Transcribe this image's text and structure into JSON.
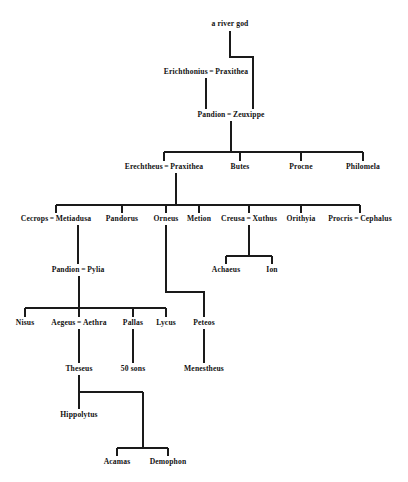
{
  "chart_data": {
    "type": "diagram",
    "diagram_kind": "family-tree",
    "line_color": "#1a1a1a",
    "background_color": "#ffffff",
    "text_color": "#111111",
    "nodes": [
      {
        "id": "river-god",
        "label": "a river god",
        "x": 230,
        "y": 24,
        "gen": 0
      },
      {
        "id": "erichthonius",
        "label": "Erichthonius",
        "partner": "Praxithea",
        "x": 206,
        "y": 72,
        "gen": 1
      },
      {
        "id": "pandion-1",
        "label": "Pandion",
        "partner": "Zeuxippe",
        "x": 231,
        "y": 115,
        "gen": 2
      },
      {
        "id": "erechtheus",
        "label": "Erechtheus",
        "partner": "Praxithea",
        "x": 164,
        "y": 167,
        "gen": 3
      },
      {
        "id": "butes",
        "label": "Butes",
        "x": 240,
        "y": 167,
        "gen": 3
      },
      {
        "id": "procne",
        "label": "Procne",
        "x": 301,
        "y": 167,
        "gen": 3
      },
      {
        "id": "philomela",
        "label": "Philomela",
        "x": 363,
        "y": 167,
        "gen": 3
      },
      {
        "id": "cecrops",
        "label": "Cecrops",
        "partner": "Metiadusa",
        "x": 56,
        "y": 219,
        "gen": 4
      },
      {
        "id": "pandorus",
        "label": "Pandorus",
        "x": 122,
        "y": 219,
        "gen": 4
      },
      {
        "id": "orneus",
        "label": "Orneus",
        "x": 166,
        "y": 219,
        "gen": 4
      },
      {
        "id": "metion",
        "label": "Metion",
        "x": 199,
        "y": 219,
        "gen": 4
      },
      {
        "id": "creusa",
        "label": "Creusa",
        "partner": "Xuthus",
        "x": 249,
        "y": 219,
        "gen": 4
      },
      {
        "id": "orithyia",
        "label": "Orithyia",
        "x": 301,
        "y": 219,
        "gen": 4
      },
      {
        "id": "procris",
        "label": "Procris",
        "partner": "Cephalus",
        "x": 360,
        "y": 219,
        "gen": 4
      },
      {
        "id": "achaeus",
        "label": "Achaeus",
        "x": 226,
        "y": 270,
        "gen": 5
      },
      {
        "id": "ion",
        "label": "Ion",
        "x": 272,
        "y": 270,
        "gen": 5
      },
      {
        "id": "pandion-2",
        "label": "Pandion",
        "partner": "Pylia",
        "x": 78,
        "y": 270,
        "gen": 5
      },
      {
        "id": "nisus",
        "label": "Nisus",
        "x": 25,
        "y": 323,
        "gen": 6
      },
      {
        "id": "aegeus",
        "label": "Aegeus",
        "partner": "Aethra",
        "x": 79,
        "y": 323,
        "gen": 6
      },
      {
        "id": "pallas",
        "label": "Pallas",
        "x": 133,
        "y": 323,
        "gen": 6
      },
      {
        "id": "lycus",
        "label": "Lycus",
        "x": 166,
        "y": 323,
        "gen": 6
      },
      {
        "id": "peteos",
        "label": "Peteos",
        "x": 204,
        "y": 323,
        "gen": 6
      },
      {
        "id": "theseus",
        "label": "Theseus",
        "x": 79,
        "y": 369,
        "gen": 7
      },
      {
        "id": "fifty-sons",
        "label": "50 sons",
        "x": 133,
        "y": 369,
        "gen": 7
      },
      {
        "id": "menestheus",
        "label": "Menestheus",
        "x": 204,
        "y": 369,
        "gen": 7
      },
      {
        "id": "hippolytus",
        "label": "Hippolytus",
        "x": 79,
        "y": 415,
        "gen": 8
      },
      {
        "id": "acamas",
        "label": "Acamas",
        "x": 117,
        "y": 462,
        "gen": 9
      },
      {
        "id": "demophon",
        "label": "Demophon",
        "x": 168,
        "y": 462,
        "gen": 9
      }
    ],
    "unions": [
      {
        "parents": [
          "river-god"
        ],
        "children": [
          "zeuxippe-link"
        ],
        "note": "a river god is father of Zeuxippe"
      },
      {
        "parents": [
          "erichthonius",
          "Praxithea"
        ],
        "children": [
          "pandion-1"
        ]
      },
      {
        "parents": [
          "pandion-1",
          "Zeuxippe"
        ],
        "children": [
          "erechtheus",
          "butes",
          "procne",
          "philomela"
        ]
      },
      {
        "parents": [
          "erechtheus",
          "Praxithea"
        ],
        "children": [
          "cecrops",
          "pandorus",
          "orneus",
          "metion",
          "creusa",
          "orithyia",
          "procris"
        ]
      },
      {
        "parents": [
          "creusa",
          "Xuthus"
        ],
        "children": [
          "achaeus",
          "ion"
        ]
      },
      {
        "parents": [
          "cecrops",
          "Metiadusa"
        ],
        "children": [
          "pandion-2"
        ]
      },
      {
        "parents": [
          "orneus"
        ],
        "children": [
          "peteos"
        ]
      },
      {
        "parents": [
          "pandion-2",
          "Pylia"
        ],
        "children": [
          "nisus",
          "aegeus",
          "pallas",
          "lycus"
        ]
      },
      {
        "parents": [
          "aegeus",
          "Aethra"
        ],
        "children": [
          "theseus"
        ]
      },
      {
        "parents": [
          "pallas"
        ],
        "children": [
          "fifty-sons"
        ]
      },
      {
        "parents": [
          "peteos"
        ],
        "children": [
          "menestheus"
        ]
      },
      {
        "parents": [
          "theseus"
        ],
        "children": [
          "hippolytus",
          "acamas",
          "demophon"
        ]
      }
    ],
    "union_symbol": "="
  },
  "labels": {
    "river_god": "a river god",
    "erichthonius": "Erichthonius",
    "praxithea_1": "Praxithea",
    "pandion_1": "Pandion",
    "zeuxippe": "Zeuxippe",
    "erechtheus": "Erechtheus",
    "praxithea_2": "Praxithea",
    "butes": "Butes",
    "procne": "Procne",
    "philomela": "Philomela",
    "cecrops": "Cecrops",
    "metiadusa": "Metiadusa",
    "pandorus": "Pandorus",
    "orneus": "Orneus",
    "metion": "Metion",
    "creusa": "Creusa",
    "xuthus": "Xuthus",
    "orithyia": "Orithyia",
    "procris": "Procris",
    "cephalus": "Cephalus",
    "achaeus": "Achaeus",
    "ion": "Ion",
    "pandion_2": "Pandion",
    "pylia": "Pylia",
    "nisus": "Nisus",
    "aegeus": "Aegeus",
    "aethra": "Aethra",
    "pallas": "Pallas",
    "lycus": "Lycus",
    "peteos": "Peteos",
    "theseus": "Theseus",
    "fifty_sons": "50 sons",
    "menestheus": "Menestheus",
    "hippolytus": "Hippolytus",
    "acamas": "Acamas",
    "demophon": "Demophon",
    "union_symbol": "="
  }
}
